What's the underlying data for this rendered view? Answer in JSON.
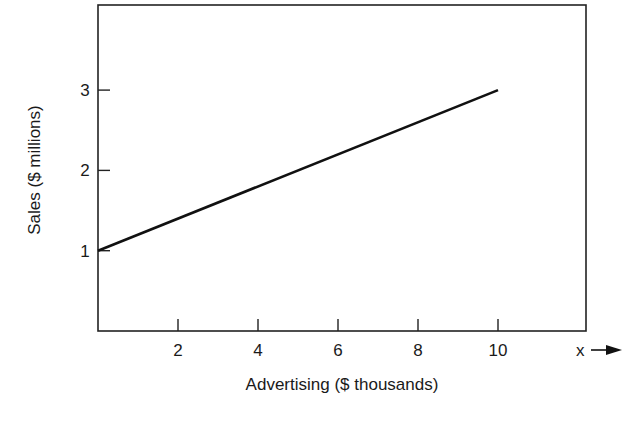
{
  "chart_data": {
    "type": "line",
    "title": "",
    "xlabel": "Advertising ($ thousands)",
    "ylabel": "Sales ($ millions)",
    "x_axis_symbol": "x",
    "xlim": [
      0,
      12.2
    ],
    "ylim": [
      0,
      4.1
    ],
    "x_ticks": [
      2,
      4,
      6,
      8,
      10
    ],
    "x_tick_labels": [
      "2",
      "4",
      "6",
      "8",
      "10"
    ],
    "y_ticks": [
      1,
      2,
      3
    ],
    "y_tick_labels": [
      "1",
      "2",
      "3"
    ],
    "grid": false,
    "legend": null,
    "series": [
      {
        "name": "Sales",
        "x": [
          0,
          10
        ],
        "y": [
          1,
          3
        ]
      }
    ],
    "colors": {
      "line": "#111111",
      "axis": "#222222",
      "background": "#ffffff"
    }
  }
}
